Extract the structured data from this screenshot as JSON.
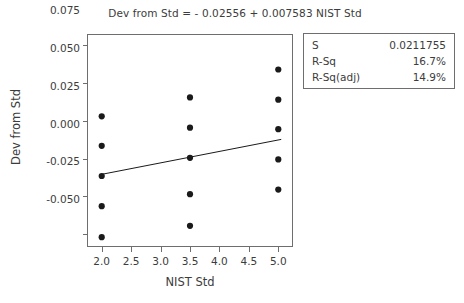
{
  "chart_data": {
    "type": "scatter",
    "title": "Dev from Std =  - 0.02556 + 0.007583 NIST Std",
    "xlabel": "NIST Std",
    "ylabel": "Dev from Std",
    "xlim": [
      1.75,
      5.25
    ],
    "ylim": [
      -0.0585,
      0.0825
    ],
    "grid": false,
    "legend_position": "none",
    "xticks": [
      "2.0",
      "2.5",
      "3.0",
      "3.5",
      "4.0",
      "4.5",
      "5.0"
    ],
    "xtick_values": [
      2.0,
      2.5,
      3.0,
      3.5,
      4.0,
      4.5,
      5.0
    ],
    "yticks": [
      "0.075",
      "0.050",
      "0.025",
      "0.000",
      "-0.025",
      "-0.050"
    ],
    "ytick_values": [
      0.075,
      0.05,
      0.025,
      0.0,
      -0.025,
      -0.05
    ],
    "marker_color": "#1a1a1a",
    "line_color": "#1a1a1a",
    "points": [
      {
        "x": 2.0,
        "y": 0.028
      },
      {
        "x": 2.0,
        "y": 0.0085
      },
      {
        "x": 2.0,
        "y": -0.0115
      },
      {
        "x": 2.0,
        "y": -0.0315
      },
      {
        "x": 2.0,
        "y": -0.052
      },
      {
        "x": 3.5,
        "y": 0.0405
      },
      {
        "x": 3.5,
        "y": 0.0205
      },
      {
        "x": 3.5,
        "y": 0.0005
      },
      {
        "x": 3.5,
        "y": -0.0235
      },
      {
        "x": 3.5,
        "y": -0.0445
      },
      {
        "x": 5.0,
        "y": 0.059
      },
      {
        "x": 5.0,
        "y": 0.039
      },
      {
        "x": 5.0,
        "y": 0.0195
      },
      {
        "x": 5.0,
        "y": -0.0005
      },
      {
        "x": 5.0,
        "y": -0.0205
      }
    ],
    "fit_line": {
      "intercept": -0.02556,
      "slope": 0.007583,
      "x_start": 2.0,
      "x_end": 5.05
    },
    "equation_terms": {
      "response": "Dev from Std",
      "intercept_text": "- 0.02556",
      "slope_text": "+ 0.007583",
      "predictor": "NIST Std"
    }
  },
  "stats_box": {
    "rows": [
      {
        "key": "S",
        "value": "0.0211755"
      },
      {
        "key": "R-Sq",
        "value": "16.7%"
      },
      {
        "key": "R-Sq(adj)",
        "value": "14.9%"
      }
    ]
  }
}
